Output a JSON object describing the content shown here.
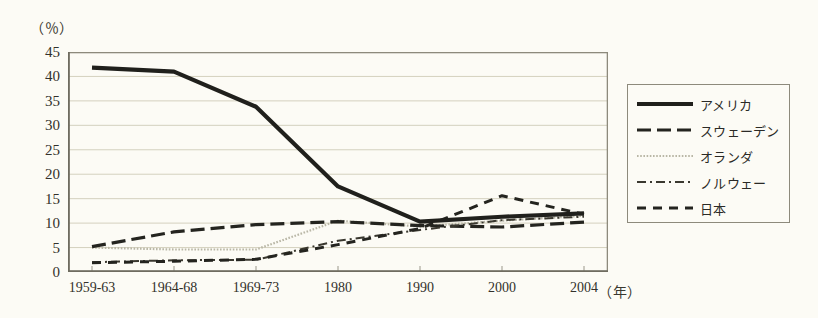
{
  "chart_data": {
    "type": "line",
    "title": "",
    "xlabel": "(年)",
    "ylabel": "(%)",
    "ylim": [
      0,
      45
    ],
    "ytick_step": 5,
    "yticks": [
      "0",
      "5",
      "10",
      "15",
      "20",
      "25",
      "30",
      "35",
      "40",
      "45"
    ],
    "grid": true,
    "grid_axis": "y",
    "legend_position": "right",
    "categories": [
      "1959-63",
      "1964-68",
      "1969-73",
      "1980",
      "1990",
      "2000",
      "2004"
    ],
    "series": [
      {
        "name": "アメリカ",
        "style": "solid-thick",
        "values": [
          41.8,
          41.0,
          33.8,
          17.5,
          10.3,
          11.3,
          12.0
        ]
      },
      {
        "name": "スウェーデン",
        "style": "long-dash",
        "values": [
          5.2,
          8.2,
          9.7,
          10.3,
          9.5,
          9.2,
          10.2
        ]
      },
      {
        "name": "オランダ",
        "style": "fine-dotted",
        "values": [
          5.0,
          4.6,
          4.6,
          10.5,
          9.3,
          10.5,
          11.5
        ]
      },
      {
        "name": "ノルウェー",
        "style": "dash-dot",
        "values": [
          2.0,
          2.4,
          2.5,
          6.4,
          8.6,
          10.6,
          11.3
        ]
      },
      {
        "name": "日本",
        "style": "medium-dash",
        "values": [
          1.9,
          2.2,
          2.6,
          5.6,
          8.9,
          15.6,
          11.8
        ]
      }
    ],
    "annotations": []
  },
  "legend": {
    "items": [
      {
        "label": "アメリカ"
      },
      {
        "label": "スウェーデン"
      },
      {
        "label": "オランダ"
      },
      {
        "label": "ノルウェー"
      },
      {
        "label": "日本"
      }
    ]
  },
  "axes": {
    "y_unit": "（％）",
    "x_unit": "（年）"
  }
}
